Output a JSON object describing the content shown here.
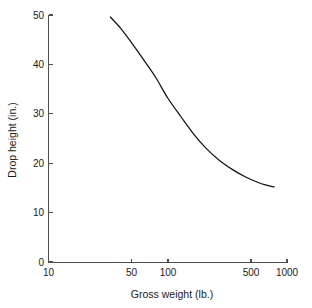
{
  "chart_data": {
    "type": "line",
    "title": "",
    "xlabel": "Gross weight (lb.)",
    "ylabel": "Drop height (in.)",
    "xscale": "log",
    "yscale": "linear",
    "xlim": [
      10,
      1000
    ],
    "ylim": [
      0,
      50
    ],
    "grid": false,
    "legend": null,
    "xticks": [
      10,
      50,
      100,
      500,
      1000
    ],
    "xticklabels": [
      "10",
      "50",
      "100",
      "500",
      "1000"
    ],
    "yticks": [
      0,
      10,
      20,
      30,
      40,
      50
    ],
    "yticklabels": [
      "0",
      "10",
      "20",
      "30",
      "40",
      "50"
    ],
    "series": [
      {
        "name": "Drop height vs gross weight",
        "color": "#111111",
        "x": [
          33,
          40,
          50,
          65,
          80,
          100,
          130,
          165,
          210,
          270,
          350,
          450,
          560,
          660,
          780
        ],
        "y": [
          49.6,
          47.4,
          44.3,
          40.4,
          37.2,
          33.2,
          29.3,
          25.9,
          23.0,
          20.6,
          18.7,
          17.2,
          16.2,
          15.6,
          15.2
        ]
      }
    ],
    "annotations": []
  },
  "axes": {
    "x_axis_label": "Gross weight (lb.)",
    "y_axis_label": "Drop height (in.)",
    "x_tick_labels": [
      "10",
      "50",
      "100",
      "500",
      "1000"
    ],
    "y_tick_labels": [
      "0",
      "10",
      "20",
      "30",
      "40",
      "50"
    ]
  }
}
